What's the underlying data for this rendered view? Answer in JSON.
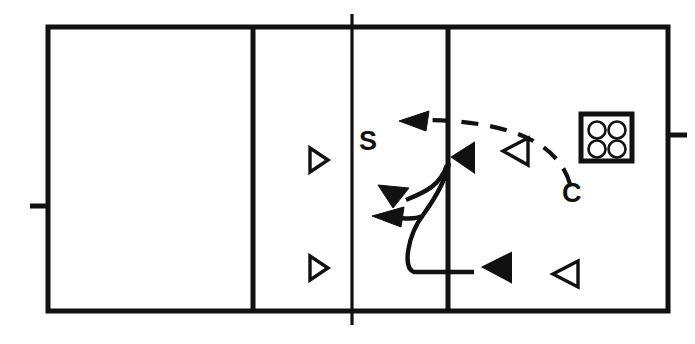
{
  "diagram": {
    "type": "court-play-diagram",
    "colors": {
      "ink": "#111111",
      "court": "#ffffff"
    },
    "labels": [
      {
        "id": "setter",
        "text": "S",
        "x": 365,
        "y": 146,
        "meaning": "setter-position-label"
      },
      {
        "id": "coach",
        "text": "C",
        "x": 568,
        "y": 196,
        "meaning": "coach-position-label"
      }
    ],
    "court": {
      "outer": {
        "x": 48,
        "y": 27,
        "width": 620,
        "height": 284
      },
      "line_width_px": 4,
      "vertical_lines": [
        {
          "id": "attack-line-left",
          "x": 253,
          "kind": "solid"
        },
        {
          "id": "center-net-line",
          "x": 352,
          "kind": "solid-extended"
        },
        {
          "id": "attack-line-right",
          "x": 448,
          "kind": "solid"
        }
      ],
      "side_ticks": [
        {
          "id": "net-post-left",
          "side": "left",
          "y": 206
        },
        {
          "id": "net-post-right",
          "side": "right",
          "y": 135
        }
      ]
    },
    "ball_cart": {
      "id": "ball-cart",
      "x": 580,
      "y": 113,
      "width": 52,
      "height": 48,
      "balls": 4,
      "meaning": "cart-of-balls"
    },
    "players": [
      {
        "id": "p1",
        "shape": "triangle",
        "fill": "hollow",
        "points": "right",
        "x": 310,
        "y": 148,
        "size": 22
      },
      {
        "id": "p2",
        "shape": "triangle",
        "fill": "hollow",
        "points": "right",
        "x": 310,
        "y": 256,
        "size": 22
      },
      {
        "id": "p3",
        "shape": "triangle",
        "fill": "solid",
        "points": "left",
        "x": 452,
        "y": 143,
        "size": 24
      },
      {
        "id": "p4",
        "shape": "triangle",
        "fill": "hollow",
        "points": "left",
        "x": 503,
        "y": 137,
        "size": 25
      },
      {
        "id": "p5",
        "shape": "triangle",
        "fill": "solid",
        "points": "left",
        "x": 483,
        "y": 253,
        "size": 26
      },
      {
        "id": "p6",
        "shape": "triangle",
        "fill": "hollow",
        "points": "left",
        "x": 551,
        "y": 260,
        "size": 26
      }
    ],
    "paths": [
      {
        "id": "ball-toss-arc",
        "style": "dashed",
        "meaning": "coach-toss-ball-flight",
        "arrowhead": "left-end"
      },
      {
        "id": "setter-approach",
        "style": "solid",
        "meaning": "setter-movement-to-net"
      },
      {
        "id": "set-option-high",
        "style": "solid",
        "meaning": "set-delivered-front-left"
      },
      {
        "id": "set-option-low",
        "style": "solid",
        "meaning": "set-delivered-back-left"
      }
    ]
  }
}
